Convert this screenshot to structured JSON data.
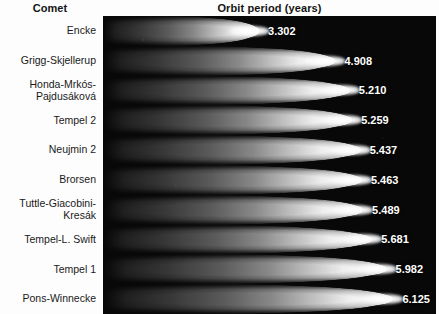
{
  "header": {
    "comet_column": "Comet",
    "period_column": "Orbit period (years)"
  },
  "colors": {
    "panel_background": "#080808",
    "page_background": "#fdfdfd",
    "comet_glow": "#ffffff",
    "label_text": "#1a1a1a",
    "value_text": "#ffffff"
  },
  "chart_data": {
    "type": "bar",
    "orientation": "horizontal",
    "title": "Orbit period (years)",
    "xlabel": "Orbit period (years)",
    "ylabel": "Comet",
    "grid": false,
    "legend": null,
    "xlim": [
      0,
      7
    ],
    "categories": [
      "Encke",
      "Grigg-Skjellerup",
      "Honda-Mrkós-Pajdusáková",
      "Tempel 2",
      "Neujmin 2",
      "Brorsen",
      "Tuttle-Giacobini-Kresák",
      "Tempel-L. Swift",
      "Tempel 1",
      "Pons-Winnecke"
    ],
    "values": [
      3.302,
      4.908,
      5.21,
      5.259,
      5.437,
      5.463,
      5.489,
      5.681,
      5.982,
      6.125
    ],
    "value_labels": [
      "3.302",
      "4.908",
      "5.210",
      "5.259",
      "5.437",
      "5.463",
      "5.489",
      "5.681",
      "5.982",
      "6.125"
    ]
  },
  "rows": [
    {
      "name_line1": "Encke",
      "name_line2": "",
      "value": "3.302"
    },
    {
      "name_line1": "Grigg-Skjellerup",
      "name_line2": "",
      "value": "4.908"
    },
    {
      "name_line1": "Honda-Mrkós-",
      "name_line2": "Pajdusáková",
      "value": "5.210"
    },
    {
      "name_line1": "Tempel 2",
      "name_line2": "",
      "value": "5.259"
    },
    {
      "name_line1": "Neujmin 2",
      "name_line2": "",
      "value": "5.437"
    },
    {
      "name_line1": "Brorsen",
      "name_line2": "",
      "value": "5.463"
    },
    {
      "name_line1": "Tuttle-Giacobini-",
      "name_line2": "Kresák",
      "value": "5.489"
    },
    {
      "name_line1": "Tempel-L. Swift",
      "name_line2": "",
      "value": "5.681"
    },
    {
      "name_line1": "Tempel 1",
      "name_line2": "",
      "value": "5.982"
    },
    {
      "name_line1": "Pons-Winnecke",
      "name_line2": "",
      "value": "6.125"
    }
  ]
}
